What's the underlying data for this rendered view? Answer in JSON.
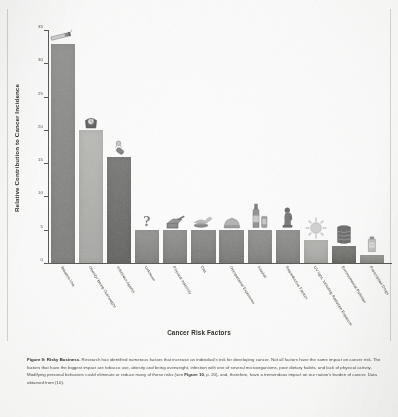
{
  "figure": {
    "caption_label": "Figure 9: Risky Business.",
    "caption_body": " Research has identified numerous factors that increase an individual's risk for developing cancer. Not all factors have the same impact on cancer risk. The factors that have the biggest impact are tobacco use, obesity and being overweight, infection with one of several microorganisms, poor dietary habits, and lack of physical activity. Modifying personal behaviors could eliminate or reduce many of these risks (see ",
    "caption_ref": "Figure 10",
    "caption_tail": ", p. 20), and, therefore, have a tremendous impact on our nation's burden of cancer. Data obtained from (10).",
    "border_color": "#d3d3d0"
  },
  "chart_data": {
    "type": "bar",
    "title": "",
    "xlabel": "Cancer Risk Factors",
    "ylabel": "Relative Contribution to Cancer Incidence",
    "ylim": [
      0,
      35
    ],
    "yticks": [
      "0",
      "5",
      "10",
      "15",
      "20",
      "25",
      "30",
      "35"
    ],
    "grid": false,
    "legend": "none",
    "categories": [
      "Tobacco Use",
      "Obesity/ Being Overweight",
      "Infectious Agents",
      "Unknown",
      "Physical Inactivity",
      "Diet",
      "Occupational Exposures",
      "Alcohol",
      "Reproductive Factors",
      "UV light, Including Radiation Exposure",
      "Environmental Pollution",
      "Prescription Drugs"
    ],
    "values": [
      33,
      20,
      16,
      5,
      5,
      5,
      5,
      5,
      5,
      3.4,
      2.6,
      1.2
    ],
    "bar_colors": [
      "#8a8a88",
      "#b4b4b1",
      "#6f6f6d",
      "#8d8d8b",
      "#8a8a88",
      "#858583",
      "#848482",
      "#8b8b89",
      "#8a8a88",
      "#b0b0ad",
      "#72726f",
      "#949491"
    ],
    "icons": [
      "cigarette-icon",
      "scale-icon",
      "virus-icon",
      "question-mark-icon",
      "exercise-equipment-icon",
      "burger-icon",
      "hard-hat-icon",
      "wine-bottle-icon",
      "pregnant-figure-icon",
      "sun-icon",
      "waste-barrel-icon",
      "pill-bottle-icon"
    ]
  }
}
